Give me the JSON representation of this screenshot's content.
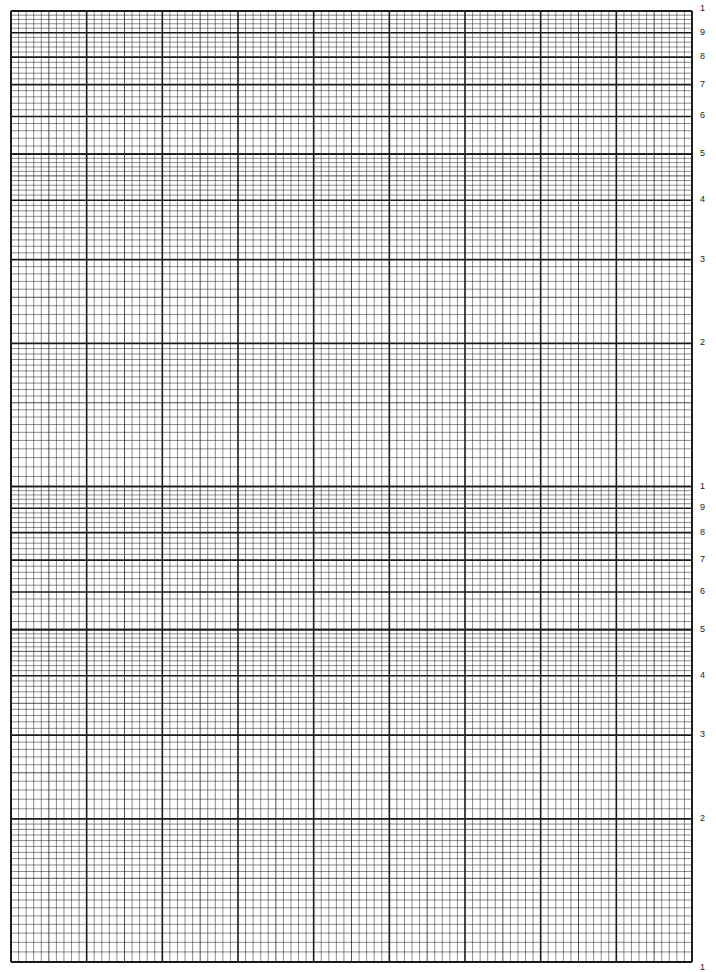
{
  "paper": {
    "type": "semi-log graph paper",
    "log_cycles": 2,
    "linear_major_divisions": 9,
    "linear_minor_per_major": 10,
    "line_color": "#1a1a1a",
    "background": "#ffffff"
  },
  "grid": {
    "left": 11,
    "right": 692,
    "top": 11,
    "bottom": 962
  },
  "axis_labels": {
    "upper_cycle": [
      "1",
      "9",
      "8",
      "7",
      "6",
      "5",
      "4",
      "3",
      "2"
    ],
    "lower_cycle": [
      "1",
      "9",
      "8",
      "7",
      "6",
      "5",
      "4",
      "3",
      "2",
      "1"
    ]
  }
}
